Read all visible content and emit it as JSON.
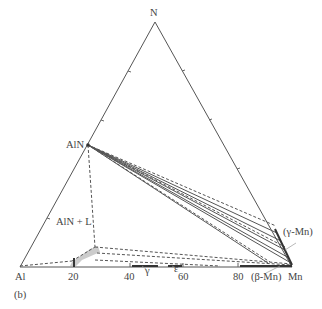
{
  "diagram": {
    "type": "ternary-phase-diagram",
    "panel_label": "(b)",
    "vertices": {
      "top": "N",
      "bottom_left": "Al",
      "bottom_right": "Mn"
    },
    "compound_labels": {
      "aln": "AlN"
    },
    "region_labels": {
      "aln_liquid": "AlN + L",
      "gamma_mn": "(γ-Mn)",
      "beta_mn": "(β-Mn)",
      "gamma": "γ",
      "epsilon": "ε"
    },
    "bottom_axis_ticks": [
      "20",
      "40",
      "60",
      "80"
    ],
    "colors": {
      "lines": "#555555",
      "shaded_region": "#cccccc",
      "text": "#444444"
    }
  }
}
